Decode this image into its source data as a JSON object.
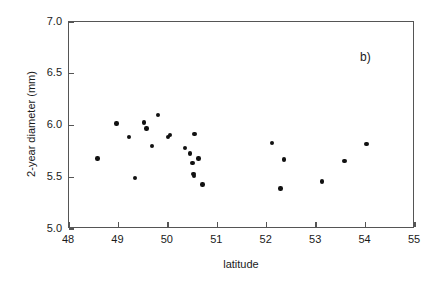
{
  "figure": {
    "panel_label": "b)",
    "background_color": "#ffffff",
    "axis_color": "#555555",
    "marker_color": "#111111"
  },
  "chart_data": {
    "type": "scatter",
    "title": "",
    "subtitle": "",
    "panel_annotation": "b)",
    "xlabel": "latitude",
    "ylabel": "2-year diameter (mm)",
    "xlim": [
      48,
      55
    ],
    "ylim": [
      5.0,
      7.0
    ],
    "xticks": [
      48,
      49,
      50,
      51,
      52,
      53,
      54,
      55
    ],
    "xtick_labels": [
      "48",
      "49",
      "50",
      "51",
      "52",
      "53",
      "54",
      "55"
    ],
    "yticks": [
      5.0,
      5.5,
      6.0,
      6.5,
      7.0
    ],
    "ytick_labels": [
      "5.0",
      "5.5",
      "6.0",
      "6.5",
      "7.0"
    ],
    "grid": false,
    "legend": null,
    "marker": "filled-circle",
    "n_points": 24,
    "x": [
      48.58,
      48.96,
      49.21,
      49.33,
      49.52,
      49.57,
      49.68,
      49.8,
      50.0,
      50.04,
      50.35,
      50.45,
      50.5,
      50.52,
      50.53,
      50.54,
      50.62,
      50.7,
      52.11,
      52.28,
      52.35,
      53.12,
      53.57,
      54.02
    ],
    "y": [
      5.68,
      6.02,
      5.89,
      5.49,
      6.03,
      5.97,
      5.8,
      6.1,
      5.89,
      5.91,
      5.78,
      5.73,
      5.64,
      5.53,
      5.51,
      5.92,
      5.68,
      5.43,
      5.83,
      5.39,
      5.67,
      5.46,
      5.66,
      5.82
    ],
    "points": [
      {
        "x": 48.58,
        "y": 5.68
      },
      {
        "x": 48.96,
        "y": 6.02
      },
      {
        "x": 49.21,
        "y": 5.89
      },
      {
        "x": 49.33,
        "y": 5.49
      },
      {
        "x": 49.52,
        "y": 6.03
      },
      {
        "x": 49.57,
        "y": 5.97
      },
      {
        "x": 49.68,
        "y": 5.8
      },
      {
        "x": 49.8,
        "y": 6.1
      },
      {
        "x": 50.0,
        "y": 5.89
      },
      {
        "x": 50.04,
        "y": 5.91
      },
      {
        "x": 50.35,
        "y": 5.78
      },
      {
        "x": 50.45,
        "y": 5.73
      },
      {
        "x": 50.5,
        "y": 5.64
      },
      {
        "x": 50.52,
        "y": 5.53
      },
      {
        "x": 50.53,
        "y": 5.51
      },
      {
        "x": 50.54,
        "y": 5.92
      },
      {
        "x": 50.62,
        "y": 5.68
      },
      {
        "x": 50.7,
        "y": 5.43
      },
      {
        "x": 52.11,
        "y": 5.83
      },
      {
        "x": 52.28,
        "y": 5.39
      },
      {
        "x": 52.35,
        "y": 5.67
      },
      {
        "x": 53.12,
        "y": 5.46
      },
      {
        "x": 53.57,
        "y": 5.66
      },
      {
        "x": 54.02,
        "y": 5.82
      }
    ]
  }
}
